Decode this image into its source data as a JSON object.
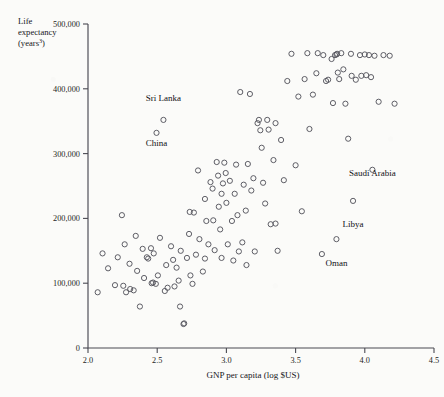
{
  "chart_data": {
    "type": "scatter",
    "title": "",
    "xlabel": "GNP per capita (log $US)",
    "ylabel_line1": "Life",
    "ylabel_line2": "expectancy",
    "ylabel_line3": "(years",
    "ylabel_sup": "3",
    "ylabel_line3_close": ")",
    "xlim": [
      2.0,
      4.5
    ],
    "ylim": [
      0,
      500000
    ],
    "xticks": [
      2.0,
      2.5,
      3.0,
      3.5,
      4.0,
      4.5
    ],
    "xticklabels": [
      "2.0",
      "2.5",
      "3.0",
      "3.5",
      "4.0",
      "4.5"
    ],
    "yticks": [
      0,
      100000,
      200000,
      300000,
      400000,
      500000
    ],
    "yticklabels": [
      "0",
      "100,000",
      "200,000",
      "300,000",
      "400,000",
      "500,000"
    ],
    "grid": false,
    "legend": false,
    "marker": "open-circle",
    "marker_color": "#55555e",
    "annotations": [
      {
        "text": "Sri Lanka",
        "x": 2.545,
        "y": 368000,
        "anchor": "middle",
        "dy": -9
      },
      {
        "text": "China",
        "x": 2.495,
        "y": 330000,
        "anchor": "middle",
        "dy": 12
      },
      {
        "text": "Saudi Arabia",
        "x": 4.055,
        "y": 252000,
        "anchor": "middle",
        "dy": -9
      },
      {
        "text": "Libya",
        "x": 3.915,
        "y": 205000,
        "anchor": "middle",
        "dy": 12
      },
      {
        "text": "Oman",
        "x": 3.795,
        "y": 145000,
        "anchor": "middle",
        "dy": 12
      }
    ],
    "points": [
      [
        2.07,
        86000
      ],
      [
        2.105,
        146000
      ],
      [
        2.145,
        123000
      ],
      [
        2.195,
        97000
      ],
      [
        2.215,
        140000
      ],
      [
        2.245,
        205000
      ],
      [
        2.255,
        96000
      ],
      [
        2.265,
        160000
      ],
      [
        2.275,
        86000
      ],
      [
        2.3,
        130000
      ],
      [
        2.305,
        91000
      ],
      [
        2.33,
        89000
      ],
      [
        2.345,
        173000
      ],
      [
        2.355,
        119000
      ],
      [
        2.375,
        64000
      ],
      [
        2.395,
        153000
      ],
      [
        2.405,
        108000
      ],
      [
        2.425,
        140000
      ],
      [
        2.435,
        138000
      ],
      [
        2.455,
        154000
      ],
      [
        2.46,
        100000
      ],
      [
        2.47,
        101000
      ],
      [
        2.475,
        146000
      ],
      [
        2.49,
        99000
      ],
      [
        2.495,
        332000
      ],
      [
        2.505,
        112000
      ],
      [
        2.52,
        170000
      ],
      [
        2.545,
        352000
      ],
      [
        2.555,
        88000
      ],
      [
        2.565,
        128000
      ],
      [
        2.575,
        93000
      ],
      [
        2.6,
        157000
      ],
      [
        2.615,
        136000
      ],
      [
        2.625,
        95000
      ],
      [
        2.64,
        124000
      ],
      [
        2.655,
        104000
      ],
      [
        2.665,
        64000
      ],
      [
        2.67,
        150000
      ],
      [
        2.69,
        37000
      ],
      [
        2.695,
        38000
      ],
      [
        2.715,
        139000
      ],
      [
        2.73,
        176000
      ],
      [
        2.74,
        112000
      ],
      [
        2.755,
        99000
      ],
      [
        2.765,
        209000
      ],
      [
        2.78,
        144000
      ],
      [
        2.795,
        274000
      ],
      [
        2.805,
        168000
      ],
      [
        2.83,
        118000
      ],
      [
        2.845,
        230000
      ],
      [
        2.855,
        196000
      ],
      [
        2.87,
        160000
      ],
      [
        2.885,
        256000
      ],
      [
        2.9,
        246000
      ],
      [
        2.905,
        197000
      ],
      [
        2.915,
        151000
      ],
      [
        2.93,
        287000
      ],
      [
        2.94,
        266000
      ],
      [
        2.945,
        218000
      ],
      [
        2.955,
        183000
      ],
      [
        2.965,
        139000
      ],
      [
        2.975,
        254000
      ],
      [
        2.985,
        286000
      ],
      [
        2.995,
        270000
      ],
      [
        3.0,
        224000
      ],
      [
        3.01,
        160000
      ],
      [
        3.025,
        258000
      ],
      [
        3.04,
        196000
      ],
      [
        3.05,
        135000
      ],
      [
        3.06,
        238000
      ],
      [
        3.07,
        283000
      ],
      [
        3.08,
        205000
      ],
      [
        3.09,
        149000
      ],
      [
        3.1,
        395000
      ],
      [
        3.115,
        163000
      ],
      [
        3.125,
        252000
      ],
      [
        3.14,
        212000
      ],
      [
        3.155,
        284000
      ],
      [
        3.17,
        392000
      ],
      [
        3.18,
        243000
      ],
      [
        3.195,
        262000
      ],
      [
        3.205,
        149000
      ],
      [
        3.225,
        347000
      ],
      [
        3.235,
        352000
      ],
      [
        3.245,
        336000
      ],
      [
        3.255,
        309000
      ],
      [
        3.265,
        255000
      ],
      [
        3.28,
        223000
      ],
      [
        3.295,
        352000
      ],
      [
        3.305,
        337000
      ],
      [
        3.32,
        191000
      ],
      [
        3.34,
        290000
      ],
      [
        3.355,
        347000
      ],
      [
        3.37,
        150000
      ],
      [
        3.395,
        321000
      ],
      [
        3.415,
        259000
      ],
      [
        3.44,
        412000
      ],
      [
        3.47,
        454000
      ],
      [
        3.5,
        282000
      ],
      [
        3.52,
        388000
      ],
      [
        3.545,
        211000
      ],
      [
        3.565,
        415000
      ],
      [
        3.585,
        455000
      ],
      [
        3.6,
        338000
      ],
      [
        3.625,
        391000
      ],
      [
        3.65,
        424000
      ],
      [
        3.66,
        455000
      ],
      [
        3.69,
        145000
      ],
      [
        3.7,
        452000
      ],
      [
        3.72,
        412000
      ],
      [
        3.735,
        414000
      ],
      [
        3.76,
        446000
      ],
      [
        3.77,
        378000
      ],
      [
        3.785,
        452000
      ],
      [
        3.795,
        453000
      ],
      [
        3.8,
        454000
      ],
      [
        3.805,
        425000
      ],
      [
        3.815,
        415000
      ],
      [
        3.83,
        455000
      ],
      [
        3.845,
        430000
      ],
      [
        3.86,
        377000
      ],
      [
        3.88,
        323000
      ],
      [
        3.9,
        454000
      ],
      [
        3.905,
        420000
      ],
      [
        3.915,
        227000
      ],
      [
        3.935,
        414000
      ],
      [
        3.965,
        452000
      ],
      [
        3.975,
        420000
      ],
      [
        4.0,
        453000
      ],
      [
        4.01,
        421000
      ],
      [
        4.03,
        452000
      ],
      [
        4.045,
        418000
      ],
      [
        4.055,
        275000
      ],
      [
        4.07,
        451000
      ],
      [
        4.1,
        380000
      ],
      [
        4.135,
        452000
      ],
      [
        4.18,
        451000
      ],
      [
        4.215,
        377000
      ],
      [
        3.795,
        168000
      ],
      [
        2.845,
        138000
      ],
      [
        3.145,
        128000
      ],
      [
        2.735,
        210000
      ],
      [
        3.355,
        192000
      ],
      [
        2.965,
        238000
      ]
    ]
  }
}
